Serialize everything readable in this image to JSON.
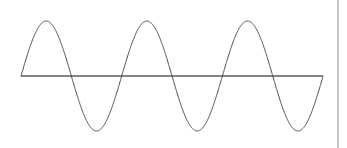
{
  "canvas": {
    "width": 347,
    "height": 148,
    "background_color": "#ffffff"
  },
  "figure": {
    "name": "sine-wave-figure",
    "curve_color": "#4a4a4a",
    "curve_width": 1,
    "axis_color": "#858585",
    "axis_width": 1.2,
    "divider_color": "#c8c8c8",
    "divider_width": 1.6,
    "divider_x": 338
  },
  "chart_data": {
    "type": "line",
    "title": "",
    "subtitle": "",
    "xlabel": "",
    "ylabel": "",
    "grid": false,
    "legend": null,
    "legend_position": "none",
    "annotations": [],
    "xlim": [
      21,
      323
    ],
    "ylim": [
      -1,
      1
    ],
    "axis_y_pixel": 76,
    "amplitude_pixels": 55,
    "period_pixels": 100.7,
    "cycles": 3,
    "phase": "sine (starts at zero, rising)",
    "zero_crossings_x": [
      21,
      71,
      122,
      172,
      222,
      273,
      323
    ],
    "peaks": [
      {
        "x": 46,
        "y": 21
      },
      {
        "x": 147,
        "y": 21
      },
      {
        "x": 247,
        "y": 21
      }
    ],
    "troughs": [
      {
        "x": 96,
        "y": 127
      },
      {
        "x": 197,
        "y": 127
      },
      {
        "x": 298,
        "y": 127
      }
    ],
    "series": [
      {
        "name": "sine",
        "equation": "y = sin(x)",
        "x": [
          21,
          29,
          38,
          46,
          54,
          63,
          71,
          79,
          88,
          96,
          104,
          113,
          121,
          130,
          138,
          147,
          155,
          163,
          172,
          180,
          188,
          197,
          205,
          214,
          222,
          230,
          239,
          247,
          256,
          264,
          272,
          281,
          289,
          298,
          306,
          315,
          323
        ],
        "values": [
          0,
          0.482,
          0.867,
          1,
          0.867,
          0.482,
          0,
          -0.482,
          -0.867,
          -1,
          -0.867,
          -0.482,
          0,
          0.482,
          0.867,
          1,
          0.867,
          0.482,
          0,
          -0.482,
          -0.867,
          -1,
          -0.867,
          -0.482,
          0,
          0.482,
          0.867,
          1,
          0.867,
          0.482,
          0,
          -0.482,
          -0.867,
          -1,
          -0.867,
          -0.482,
          0
        ]
      }
    ],
    "axis_baseline": {
      "name": "zero-axis",
      "x_start": 21,
      "x_end": 323,
      "value": 0
    }
  }
}
